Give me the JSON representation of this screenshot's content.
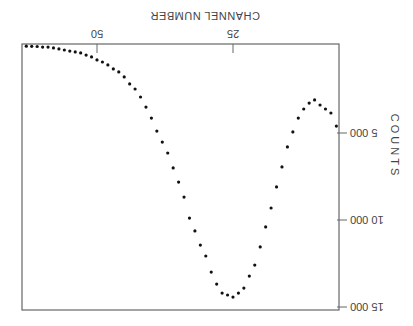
{
  "chart_data": {
    "type": "scatter",
    "title": "",
    "xlabel": "CHANNEL  NUMBER",
    "ylabel": "COUNTS",
    "orientation_note": "figure rendered rotated 180 degrees",
    "xlim": [
      5.5,
      63.8
    ],
    "ylim": [
      0,
      15000
    ],
    "x_ticks": [
      25,
      50
    ],
    "x_tick_labels": [
      "25",
      "50"
    ],
    "y_ticks": [
      5000,
      10000,
      15000
    ],
    "y_tick_labels": [
      "5 000",
      "10 000",
      "15 000"
    ],
    "grid": false,
    "legend": null,
    "series": [
      {
        "name": "counts",
        "x": [
          6,
          7,
          8,
          9,
          10,
          11,
          12,
          13,
          14,
          15,
          16,
          17,
          18,
          19,
          20,
          21,
          22,
          23,
          24,
          25,
          26,
          27,
          28,
          29,
          30,
          31,
          32,
          33,
          34,
          35,
          36,
          37,
          38,
          39,
          40,
          41,
          42,
          43,
          44,
          45,
          46,
          47,
          48,
          49,
          50,
          51,
          52,
          53,
          54,
          55,
          56,
          57,
          58,
          59,
          60,
          61,
          62,
          63
        ],
        "values": [
          4600,
          3850,
          3620,
          3390,
          3100,
          3280,
          3620,
          4140,
          4940,
          5800,
          6950,
          8100,
          9310,
          10400,
          11550,
          12590,
          13220,
          13910,
          14200,
          14430,
          14310,
          14200,
          13680,
          12990,
          12070,
          11440,
          10630,
          9890,
          8680,
          7820,
          7010,
          6150,
          5520,
          4890,
          4140,
          3510,
          2930,
          2470,
          2180,
          1780,
          1490,
          1320,
          1090,
          920,
          800,
          630,
          520,
          400,
          340,
          290,
          230,
          170,
          110,
          60,
          60,
          30,
          20,
          10
        ]
      }
    ]
  },
  "labels": {
    "xlabel": "CHANNEL  NUMBER",
    "ylabel": "COUNTS",
    "x_tick_25": "25",
    "x_tick_50": "50",
    "y_tick_5000": "5 000",
    "y_tick_10000": "10 000",
    "y_tick_15000": "15 000"
  }
}
